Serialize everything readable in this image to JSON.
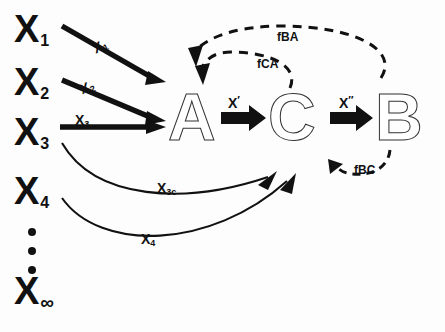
{
  "diagram": {
    "canvas": {
      "width": 445,
      "height": 332,
      "background": "#fdfdfd"
    },
    "colors": {
      "ink": "#111111",
      "letter_fill": "#ffffff",
      "letter_stroke": "#333333",
      "arrow": "#111111",
      "dashed": "#111111"
    },
    "source_nodes": [
      {
        "id": "x1",
        "base": "X",
        "sub": "1",
        "x": 14,
        "y": 10
      },
      {
        "id": "x2",
        "base": "X",
        "sub": "2",
        "x": 14,
        "y": 63
      },
      {
        "id": "x3",
        "base": "X",
        "sub": "3",
        "x": 14,
        "y": 113
      },
      {
        "id": "x4",
        "base": "X",
        "sub": "4",
        "x": 14,
        "y": 172
      },
      {
        "id": "xinf",
        "base": "X",
        "sub": "∞",
        "x": 14,
        "y": 272
      }
    ],
    "ellipsis": {
      "label": "vertical-dots",
      "count": 3,
      "x": 28,
      "y": 228
    },
    "states": [
      {
        "id": "A",
        "label": "A",
        "x": 168,
        "y": 84
      },
      {
        "id": "C",
        "label": "C",
        "x": 268,
        "y": 84
      },
      {
        "id": "B",
        "label": "B",
        "x": 375,
        "y": 84
      }
    ],
    "input_edges": [
      {
        "id": "e-x1-a",
        "label_base": "X",
        "label_sub": "1",
        "from": "x1",
        "to": "A",
        "style": "solid-straight",
        "label_x": 93,
        "label_y": 38,
        "label_rot": -27
      },
      {
        "id": "e-x2-a",
        "label_base": "X",
        "label_sub": "2",
        "from": "x2",
        "to": "A",
        "style": "solid-straight",
        "label_x": 80,
        "label_y": 79,
        "label_rot": -22
      },
      {
        "id": "e-x3-a",
        "label_base": "X",
        "label_sub": "3",
        "from": "x3",
        "to": "A",
        "style": "solid-straight",
        "label_x": 75,
        "label_y": 112,
        "label_rot": 0
      },
      {
        "id": "e-x3c-c",
        "label_base": "X",
        "label_sub": "3c",
        "from": "x3",
        "to": "C",
        "style": "solid-curved",
        "label_x": 157,
        "label_y": 180,
        "label_rot": 0
      },
      {
        "id": "e-x4-c",
        "label_base": "X",
        "label_sub": "4",
        "from": "x4",
        "to": "C",
        "style": "solid-curved",
        "label_x": 141,
        "label_y": 231,
        "label_rot": 0
      }
    ],
    "transition_edges": [
      {
        "id": "e-a-c",
        "label_base": "X",
        "label_prime": "′",
        "from": "A",
        "to": "C",
        "style": "block-arrow",
        "label_x": 228,
        "label_y": 95
      },
      {
        "id": "e-c-b",
        "label_base": "X",
        "label_prime": "″",
        "from": "C",
        "to": "B",
        "style": "block-arrow",
        "label_x": 339,
        "label_y": 95
      }
    ],
    "feedback_edges": [
      {
        "id": "f-ba",
        "label": "fBA",
        "from": "B",
        "to": "A",
        "style": "dashed-curved",
        "label_x": 277,
        "label_y": 30
      },
      {
        "id": "f-ca",
        "label": "fCA",
        "from": "C",
        "to": "A",
        "style": "dashed-curved",
        "label_x": 257,
        "label_y": 57
      },
      {
        "id": "f-bc",
        "label": "fBC",
        "from": "B",
        "to": "C",
        "style": "dashed-curved",
        "label_x": 354,
        "label_y": 163
      }
    ]
  }
}
